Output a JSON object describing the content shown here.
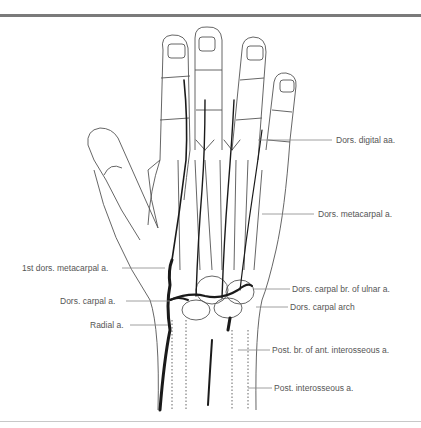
{
  "figure": {
    "labels": {
      "dors_digital": "Dors. digital aa.",
      "dors_metacarpal": "Dors. metacarpal a.",
      "first_dors_metacarpal": "1st dors. metacarpal a.",
      "dors_carpal": "Dors. carpal a.",
      "radial": "Radial a.",
      "dors_carpal_br_ulnar": "Dors. carpal br. of ulnar a.",
      "dors_carpal_arch": "Dors. carpal arch",
      "post_br_ant_interosseous": "Post. br. of ant. interosseous a.",
      "post_interosseous": "Post. interosseous a."
    },
    "colors": {
      "outline": "#555555",
      "artery": "#1a1a1a",
      "leader": "#888888",
      "text": "#555555"
    }
  }
}
